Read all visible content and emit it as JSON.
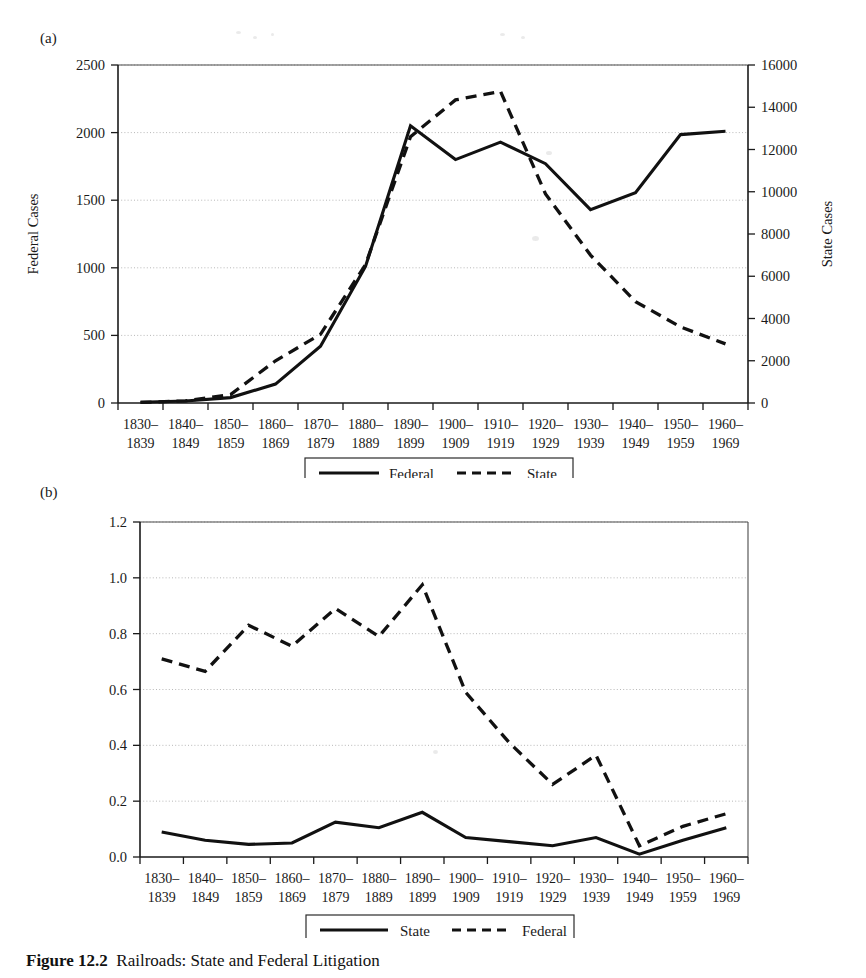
{
  "figure": {
    "caption_number": "Figure 12.2",
    "caption_text": "Railroads: State and Federal Litigation"
  },
  "panel_a": {
    "label": "(a)",
    "left_axis_title": "Federal Cases",
    "right_axis_title": "State Cases",
    "legend": [
      {
        "label": "Federal",
        "style": "solid"
      },
      {
        "label": "State",
        "style": "dashed"
      }
    ]
  },
  "panel_b": {
    "label": "(b)",
    "legend": [
      {
        "label": "State",
        "style": "solid"
      },
      {
        "label": "Federal",
        "style": "dashed"
      }
    ]
  },
  "chart_data": [
    {
      "panel": "(a)",
      "type": "line",
      "title": "",
      "xlabel": "",
      "ylabel": "Federal Cases",
      "y2label": "State Cases",
      "ylim": [
        0,
        2500
      ],
      "y2lim": [
        0,
        16000
      ],
      "yticks": [
        0,
        500,
        1000,
        1500,
        2000,
        2500
      ],
      "y2ticks": [
        0,
        2000,
        4000,
        6000,
        8000,
        10000,
        12000,
        14000,
        16000
      ],
      "grid": true,
      "legend_position": "below-center",
      "categories": [
        "1830-1839",
        "1840-1849",
        "1850-1859",
        "1860-1869",
        "1870-1879",
        "1880-1889",
        "1890-1899",
        "1900-1909",
        "1910-1919",
        "1920-1929",
        "1930-1939",
        "1940-1949",
        "1950-1959",
        "1960-1969"
      ],
      "tick_labels_top": [
        "1830–",
        "1840–",
        "1850–",
        "1860–",
        "1870–",
        "1880–",
        "1890–",
        "1900–",
        "1910–",
        "1920–",
        "1930–",
        "1940–",
        "1950–",
        "1960–"
      ],
      "tick_labels_bottom": [
        "1839",
        "1849",
        "1859",
        "1869",
        "1879",
        "1889",
        "1899",
        "1909",
        "1919",
        "1929",
        "1939",
        "1949",
        "1959",
        "1969"
      ],
      "series": [
        {
          "name": "Federal",
          "axis": "left",
          "style": "solid",
          "values": [
            5,
            15,
            40,
            140,
            420,
            1010,
            2050,
            1800,
            1930,
            1770,
            1430,
            1555,
            1985,
            2010
          ]
        },
        {
          "name": "State",
          "axis": "right",
          "style": "dashed",
          "values": [
            30,
            100,
            400,
            2000,
            3250,
            6550,
            12600,
            14350,
            14750,
            9900,
            7000,
            4800,
            3600,
            2800
          ]
        }
      ]
    },
    {
      "panel": "(b)",
      "type": "line",
      "title": "",
      "xlabel": "",
      "ylabel": "",
      "ylim": [
        0.0,
        1.2
      ],
      "yticks": [
        0.0,
        0.2,
        0.4,
        0.6,
        0.8,
        1.0,
        1.2
      ],
      "ytick_labels": [
        "0.0",
        "0.2",
        "0.4",
        "0.6",
        "0.8",
        "1.0",
        "1.2"
      ],
      "grid": true,
      "legend_position": "below-center",
      "categories": [
        "1830-1839",
        "1840-1849",
        "1850-1859",
        "1860-1869",
        "1870-1879",
        "1880-1889",
        "1890-1899",
        "1900-1909",
        "1910-1919",
        "1920-1929",
        "1930-1939",
        "1940-1949",
        "1950-1959",
        "1960-1969"
      ],
      "tick_labels_top": [
        "1830–",
        "1840–",
        "1850–",
        "1860–",
        "1870–",
        "1880–",
        "1890–",
        "1900–",
        "1910–",
        "1920–",
        "1930–",
        "1940–",
        "1950–",
        "1960–"
      ],
      "tick_labels_bottom": [
        "1839",
        "1849",
        "1859",
        "1869",
        "1879",
        "1889",
        "1899",
        "1909",
        "1919",
        "1929",
        "1939",
        "1949",
        "1959",
        "1969"
      ],
      "series": [
        {
          "name": "State",
          "style": "solid",
          "values": [
            0.09,
            0.06,
            0.045,
            0.05,
            0.125,
            0.105,
            0.16,
            0.07,
            0.055,
            0.04,
            0.07,
            0.01,
            0.06,
            0.105
          ]
        },
        {
          "name": "Federal",
          "style": "dashed",
          "values": [
            0.71,
            0.665,
            0.83,
            0.755,
            0.89,
            0.79,
            0.975,
            0.59,
            0.41,
            0.26,
            0.365,
            0.04,
            0.11,
            0.155
          ]
        }
      ]
    }
  ]
}
